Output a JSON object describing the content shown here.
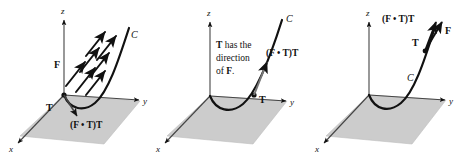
{
  "figure": {
    "background_color": "#ffffff",
    "plane_color": "#cccccc",
    "ink_color": "#111111",
    "panel_count": 3
  },
  "axes": {
    "x_label": "x",
    "y_label": "y",
    "z_label": "z"
  },
  "panels": [
    {
      "id": "panel-1",
      "curve_label": "C",
      "field_label": "F",
      "tangent_label": "T",
      "projection_label": "(F • T)T",
      "field_arrow_count": 7,
      "caption_lines": []
    },
    {
      "id": "panel-2",
      "curve_label": "C",
      "field_label": "F",
      "tangent_label": "T",
      "projection_label": "(F • T)T",
      "field_arrow_count": 0,
      "caption_lines": [
        "T has the",
        "direction",
        "of F."
      ]
    },
    {
      "id": "panel-3",
      "curve_label": "C",
      "field_label": "F",
      "tangent_label": "T",
      "projection_label": "(F • T)T",
      "field_arrow_count": 0,
      "caption_lines": []
    }
  ]
}
